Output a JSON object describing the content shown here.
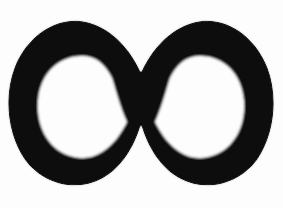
{
  "image": {
    "kind": "symbol-artwork",
    "subject": "infinity-symbol",
    "glyph": "∞",
    "style": "hand-drawn solid ink lemniscate, scanned",
    "width": 283,
    "height": 208,
    "text_content": "",
    "colors": {
      "background": "#fdfdfd",
      "ink": "#0a0a0a",
      "hole": "#fdfdfd"
    },
    "geometry": {
      "bounds": {
        "x": 10,
        "y": 21,
        "width": 262,
        "height": 165
      },
      "crossing_point": {
        "x": 141,
        "y": 103
      },
      "stroke_thickness_side": 23,
      "stroke_thickness_top": 34,
      "left_lobe": {
        "outer": {
          "cx": 79,
          "cy": 103,
          "rx": 69,
          "ry": 82
        },
        "hole": {
          "x": 38,
          "y": 55,
          "width": 90,
          "height": 103,
          "tip": "right"
        }
      },
      "right_lobe": {
        "outer": {
          "cx": 203,
          "cy": 103,
          "rx": 69,
          "ry": 82
        },
        "hole": {
          "x": 154,
          "y": 55,
          "width": 90,
          "height": 103,
          "tip": "left"
        }
      }
    },
    "paths": {
      "outer_outline": "M 141 74 C 131 52 114 30 88 23 C 57 15 27 37 15 68 C 4 97 8 134 25 159 C 43 184 76 192 102 178 C 124 166 136 141 141 122 C 146 141 158 166 180 178 C 206 192 239 184 257 159 C 274 134 278 97 267 68 C 255 37 225 15 194 23 C 168 30 151 52 141 74 Z",
      "left_hole": "M 82 56 C 57 56 40 75 38 101 C 36 128 50 152 74 157 C 97 162 115 146 127 122 C 119 104 116 90 112 78 C 105 64 96 56 82 56 Z",
      "right_hole": "M 200 56 C 225 56 242 75 244 101 C 246 128 232 152 208 157 C 185 162 167 146 155 122 C 163 104 166 90 170 78 C 177 64 186 56 200 56 Z"
    }
  }
}
